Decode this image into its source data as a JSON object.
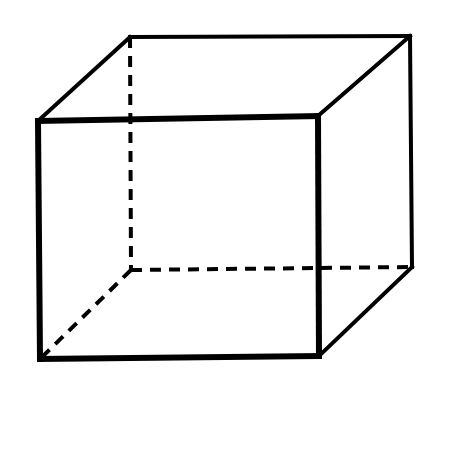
{
  "diagram": {
    "style": "wireframe-with-hidden-edges",
    "stroke_color": "#000000",
    "background": "#ffffff",
    "vertices": {
      "front_top_left": [
        38,
        121
      ],
      "front_top_right": [
        318,
        116
      ],
      "front_bottom_right": [
        319,
        356
      ],
      "front_bottom_left": [
        40,
        359
      ],
      "back_top_left": [
        130,
        37
      ],
      "back_top_right": [
        410,
        36
      ],
      "back_bottom_right": [
        412,
        267
      ],
      "back_bottom_left": [
        131,
        270
      ]
    },
    "solid_edges": [
      [
        "front_top_left",
        "front_top_right",
        6
      ],
      [
        "front_top_right",
        "front_bottom_right",
        6
      ],
      [
        "front_bottom_right",
        "front_bottom_left",
        6
      ],
      [
        "front_bottom_left",
        "front_top_left",
        6
      ],
      [
        "front_top_left",
        "back_top_left",
        4
      ],
      [
        "back_top_left",
        "back_top_right",
        4
      ],
      [
        "back_top_right",
        "front_top_right",
        4
      ],
      [
        "back_top_right",
        "back_bottom_right",
        4
      ],
      [
        "back_bottom_right",
        "front_bottom_right",
        4
      ]
    ],
    "hidden_edges": [
      [
        "back_top_left",
        "back_bottom_left"
      ],
      [
        "back_bottom_left",
        "back_bottom_right"
      ],
      [
        "back_bottom_left",
        "front_bottom_left"
      ]
    ]
  }
}
